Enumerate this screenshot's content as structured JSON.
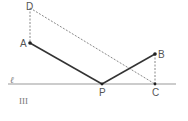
{
  "diagram": {
    "label": "III",
    "line_label": "ℓ",
    "points": {
      "D": {
        "label": "D",
        "x": 30,
        "y": 8
      },
      "A": {
        "label": "A",
        "x": 30,
        "y": 43
      },
      "P": {
        "label": "P",
        "x": 102,
        "y": 84
      },
      "B": {
        "label": "B",
        "x": 155,
        "y": 54
      },
      "C": {
        "label": "C",
        "x": 155,
        "y": 84
      }
    },
    "colors": {
      "solid": "#333333",
      "dashed": "#888888",
      "line": "#999999"
    }
  }
}
